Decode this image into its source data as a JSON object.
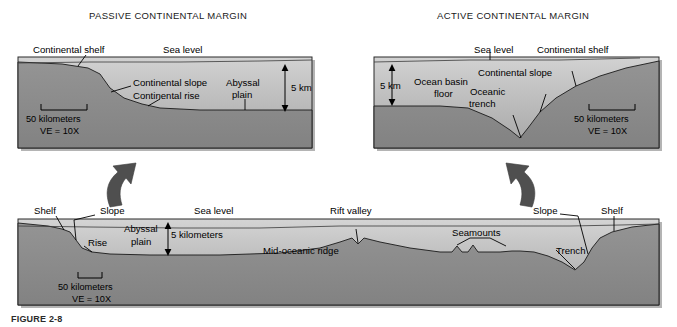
{
  "figure": {
    "background_color": "#ffffff",
    "water_color_top": "#c9c9c9",
    "water_color_bottom": "#9a9a9a",
    "crust_color": "#8c8c8c",
    "outline_color": "#1a1a1a",
    "arrow_color": "#555555",
    "caption": "FIGURE 2-8"
  },
  "panels": {
    "passive": {
      "title": "PASSIVE CONTINENTAL MARGIN",
      "labels": {
        "continental_shelf": "Continental shelf",
        "sea_level": "Sea level",
        "continental_slope": "Continental slope",
        "continental_rise": "Continental rise",
        "abyssal_plain_line1": "Abyssal",
        "abyssal_plain_line2": "plain",
        "depth": "5 km"
      },
      "scale": {
        "distance": "50 kilometers",
        "exaggeration": "VE = 10X"
      }
    },
    "active": {
      "title": "ACTIVE CONTINENTAL MARGIN",
      "labels": {
        "sea_level": "Sea level",
        "continental_shelf": "Continental shelf",
        "continental_slope": "Continental slope",
        "ocean_basin_line1": "Ocean basin",
        "ocean_basin_line2": "floor",
        "oceanic_trench_line1": "Oceanic",
        "oceanic_trench_line2": "trench",
        "depth": "5 km"
      },
      "scale": {
        "distance": "50 kilometers",
        "exaggeration": "VE = 10X"
      }
    },
    "profile": {
      "labels": {
        "shelf_left": "Shelf",
        "slope_left": "Slope",
        "rise": "Rise",
        "abyssal_plain_line1": "Abyssal",
        "abyssal_plain_line2": "plain",
        "sea_level": "Sea level",
        "depth": "5 kilometers",
        "rift_valley": "Rift valley",
        "mid_oceanic_ridge": "Mid-oceanic ridge",
        "seamounts": "Seamounts",
        "trench": "Trench",
        "slope_right": "Slope",
        "shelf_right": "Shelf"
      },
      "scale": {
        "distance": "50 kilometers",
        "exaggeration": "VE = 10X"
      }
    }
  }
}
